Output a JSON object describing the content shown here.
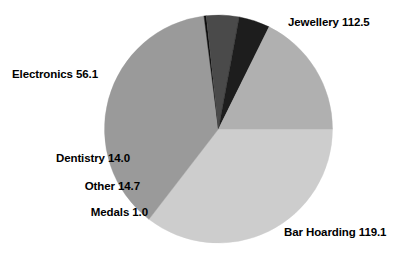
{
  "chart_data": {
    "type": "pie",
    "title": "",
    "subtitle": "",
    "xlabel": "",
    "ylabel": "",
    "legend_position": "none",
    "grid": false,
    "total": 317.4,
    "start_angle_deg": 0,
    "direction": "clockwise",
    "categories": [
      "Jewellery",
      "Bar Hoarding",
      "Medals",
      "Other",
      "Dentistry",
      "Electronics"
    ],
    "values": [
      112.5,
      119.1,
      1.0,
      14.7,
      14.0,
      56.1
    ],
    "slices": [
      {
        "name": "Jewellery",
        "label": "Jewellery 112.5",
        "value": 112.5,
        "percent": 35.4,
        "angle_deg": 127.6,
        "color": "#cdcdcd",
        "label_position": "top-right"
      },
      {
        "name": "Bar Hoarding",
        "label": "Bar Hoarding 119.1",
        "value": 119.1,
        "percent": 37.5,
        "angle_deg": 135.1,
        "color": "#9a9a9a",
        "label_position": "bottom-right"
      },
      {
        "name": "Medals",
        "label": "Medals 1.0",
        "value": 1.0,
        "percent": 0.3,
        "angle_deg": 1.1,
        "color": "#0c0c0c",
        "label_position": "left"
      },
      {
        "name": "Other",
        "label": "Other 14.7",
        "value": 14.7,
        "percent": 4.6,
        "angle_deg": 16.7,
        "color": "#4a4a4a",
        "label_position": "left"
      },
      {
        "name": "Dentistry",
        "label": "Dentistry 14.0",
        "value": 14.0,
        "percent": 4.4,
        "angle_deg": 15.9,
        "color": "#1d1d1d",
        "label_position": "left"
      },
      {
        "name": "Electronics",
        "label": "Electronics 56.1",
        "value": 56.1,
        "percent": 17.7,
        "angle_deg": 63.6,
        "color": "#b0b0b0",
        "label_position": "top-left"
      }
    ],
    "geometry": {
      "center_x": 218.5,
      "center_y": 129,
      "radius": 114
    },
    "background_color": "#ffffff",
    "text_color": "#000000"
  }
}
